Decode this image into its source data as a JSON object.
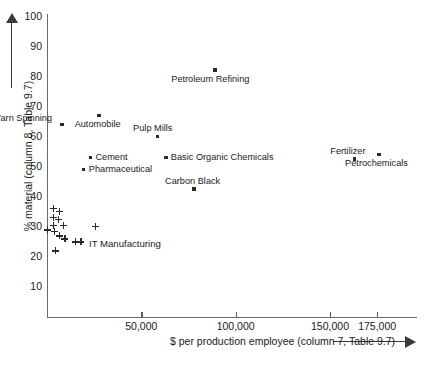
{
  "chart_data": {
    "type": "scatter",
    "title": "",
    "xlabel": "$ per production employee (column 7, Table 9.7)",
    "ylabel": "% material (column 8, Table 9.7)",
    "xlim": [
      0,
      195000
    ],
    "ylim": [
      0,
      100
    ],
    "grid": false,
    "legend": "none",
    "xticks": [
      50000,
      100000,
      150000,
      175000
    ],
    "xtick_labels": [
      "50,000",
      "100,000",
      "150,000",
      "175,000"
    ],
    "yticks": [
      10,
      20,
      30,
      40,
      50,
      60,
      70,
      80,
      90,
      100
    ],
    "ytick_labels": [
      "10",
      "20",
      "30",
      "40",
      "50",
      "60",
      "70",
      "80",
      "90",
      "100"
    ],
    "series": [
      {
        "name": "Named industries",
        "marker": "square",
        "points": [
          {
            "label": "Yarn Spinning",
            "x": 8000,
            "y": 64,
            "label_pos": "left"
          },
          {
            "label": "Automobile",
            "x": 27500,
            "y": 67,
            "label_pos": "below"
          },
          {
            "label": "Petroleum Refining",
            "x": 89000,
            "y": 82,
            "label_pos": "below"
          },
          {
            "label": "Pulp Mills",
            "x": 58500,
            "y": 60,
            "label_pos": "above"
          },
          {
            "label": "Basic Organic Chemicals",
            "x": 63000,
            "y": 53,
            "label_pos": "right"
          },
          {
            "label": "Cement",
            "x": 23000,
            "y": 53,
            "label_pos": "right"
          },
          {
            "label": "Pharmaceutical",
            "x": 19500,
            "y": 49,
            "label_pos": "right"
          },
          {
            "label": "Carbon Black",
            "x": 78000,
            "y": 42.5,
            "label_pos": "above"
          },
          {
            "label": "Fertilizer",
            "x": 163000,
            "y": 52.5,
            "label_pos": "above"
          },
          {
            "label": "Petrochemicals",
            "x": 176000,
            "y": 54,
            "label_pos": "below"
          }
        ]
      },
      {
        "name": "IT Manufacturing",
        "marker": "plus",
        "cluster_label": "IT Manufacturing",
        "points": [
          {
            "x": 3500,
            "y": 36
          },
          {
            "x": 6500,
            "y": 35
          },
          {
            "x": 3500,
            "y": 33
          },
          {
            "x": 6000,
            "y": 32.5
          },
          {
            "x": 3500,
            "y": 30.5
          },
          {
            "x": 8500,
            "y": 30.5
          },
          {
            "x": 300,
            "y": 29
          },
          {
            "x": 4000,
            "y": 28.5
          },
          {
            "x": 6500,
            "y": 27
          },
          {
            "x": 9500,
            "y": 26
          },
          {
            "x": 15000,
            "y": 25
          },
          {
            "x": 18000,
            "y": 25
          },
          {
            "x": 25500,
            "y": 30
          },
          {
            "x": 4500,
            "y": 22
          }
        ]
      }
    ]
  }
}
